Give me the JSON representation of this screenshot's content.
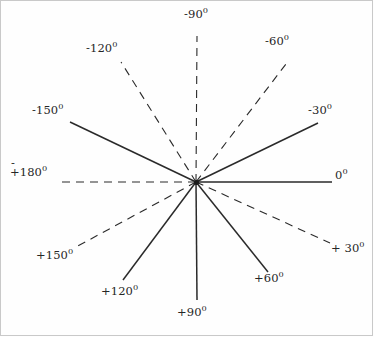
{
  "figure": {
    "center": {
      "x": 196,
      "y": 182
    },
    "frame": {
      "stroke": "#c9c9c9",
      "visible": true
    },
    "line_color": "#2a2a2a",
    "background": "#fefefe",
    "degree_glyph": "0",
    "interval_degrees": 30,
    "ray_count": 12
  },
  "chart_data": {
    "type": "scatter",
    "xlabel": "",
    "ylabel": "",
    "center": {
      "x": 196,
      "y": 182
    },
    "angle_unit": "degrees",
    "rays": [
      {
        "label": "0",
        "angle": 0,
        "style": "solid",
        "end": {
          "x": 332,
          "y": 182
        }
      },
      {
        "label": "-30",
        "angle": -30,
        "style": "solid",
        "end": {
          "x": 318,
          "y": 123
        }
      },
      {
        "label": "-60",
        "angle": -60,
        "style": "dashed",
        "end": {
          "x": 289,
          "y": 60
        }
      },
      {
        "label": "-90",
        "angle": -90,
        "style": "dashed",
        "end": {
          "x": 197,
          "y": 36
        }
      },
      {
        "label": "-120",
        "angle": -120,
        "style": "dashed",
        "end": {
          "x": 121,
          "y": 62
        }
      },
      {
        "label": "-150",
        "angle": -150,
        "style": "solid",
        "end": {
          "x": 70,
          "y": 122
        }
      },
      {
        "label": "180",
        "angle": 180,
        "style": "dashed",
        "end": {
          "x": 56,
          "y": 182
        }
      },
      {
        "label": "+150",
        "angle": 150,
        "style": "dashed",
        "end": {
          "x": 76,
          "y": 247
        }
      },
      {
        "label": "+120",
        "angle": 120,
        "style": "solid",
        "end": {
          "x": 123,
          "y": 280
        }
      },
      {
        "label": "+90",
        "angle": 90,
        "style": "solid",
        "end": {
          "x": 197,
          "y": 300
        }
      },
      {
        "label": "+60",
        "angle": 60,
        "style": "solid",
        "end": {
          "x": 268,
          "y": 272
        }
      },
      {
        "label": "+30",
        "angle": 30,
        "style": "dashed",
        "end": {
          "x": 330,
          "y": 243
        }
      }
    ]
  },
  "labels": {
    "deg_minus_90": {
      "text": "-90",
      "sup": "0"
    },
    "deg_minus_60": {
      "text": "-60",
      "sup": "0"
    },
    "deg_minus_120": {
      "text": "-120",
      "sup": "0"
    },
    "deg_minus_150": {
      "text": "-150",
      "sup": "0"
    },
    "deg_minus_30": {
      "text": "-30",
      "sup": "0"
    },
    "deg_zero": {
      "text": "0",
      "sup": "0"
    },
    "deg_pm_180": {
      "minus": "-",
      "text": "+180",
      "sup": "0"
    },
    "deg_plus_150": {
      "text": "+150",
      "sup": "0"
    },
    "deg_plus_120": {
      "text": "+120",
      "sup": "0"
    },
    "deg_plus_90": {
      "text": "+90",
      "sup": "0"
    },
    "deg_plus_60": {
      "text": "+60",
      "sup": "0"
    },
    "deg_plus_30": {
      "text": "+ 30",
      "sup": "0"
    }
  }
}
